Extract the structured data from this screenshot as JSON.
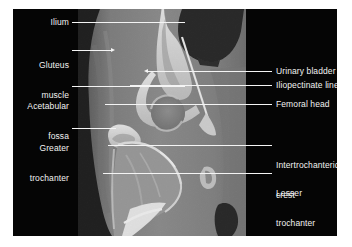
{
  "figure": {
    "type": "annotated-ct-scan",
    "modality": "CT",
    "region": "hip",
    "plane": "coronal",
    "background_color": "#ffffff",
    "plate_color": "#050505",
    "label_color": "#f2f2f2",
    "leader_color": "#f4f4f4"
  },
  "labels": {
    "left": [
      {
        "text": "Ilium",
        "lines": [
          "Ilium"
        ]
      },
      {
        "text": "Gluteus muscle",
        "lines": [
          "Gluteus",
          "muscle"
        ]
      },
      {
        "text": "Acetabular fossa",
        "lines": [
          "Acetabular",
          "fossa"
        ]
      },
      {
        "text": "Greater trochanter",
        "lines": [
          "Greater",
          "trochanter"
        ]
      }
    ],
    "right": [
      {
        "text": "Urinary bladder",
        "lines": [
          "Urinary bladder"
        ]
      },
      {
        "text": "Iliopectinate line",
        "lines": [
          "Iliopectinate line"
        ]
      },
      {
        "text": "Femoral head",
        "lines": [
          "Femoral head"
        ]
      },
      {
        "text": "Intertrochanteric crest",
        "lines": [
          "Intertrochanteric",
          "crest"
        ]
      },
      {
        "text": "Lesser trochanter",
        "lines": [
          "Lesser",
          "trochanter"
        ]
      }
    ]
  },
  "text": {
    "ilium": "Ilium",
    "gluteus_1": "Gluteus",
    "gluteus_2": "muscle",
    "acetabular_1": "Acetabular",
    "acetabular_2": "fossa",
    "greater_1": "Greater",
    "greater_2": "trochanter",
    "urinary_bladder": "Urinary bladder",
    "iliopectinate_line": "Iliopectinate line",
    "femoral_head": "Femoral head",
    "intertrochanteric_1": "Intertrochanteric",
    "intertrochanteric_2": "crest",
    "lesser_1": "Lesser",
    "lesser_2": "trochanter"
  }
}
